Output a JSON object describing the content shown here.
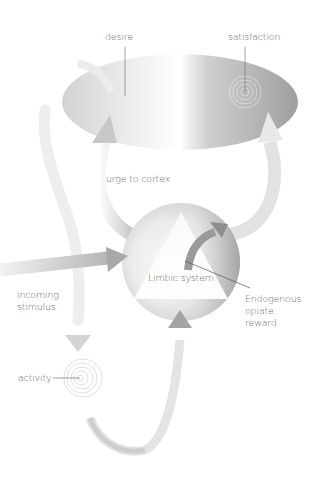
{
  "diagram": {
    "labels": {
      "desire": "desire",
      "satisfaction": "satisfaction",
      "urge": "urge to cortex",
      "limbic": "Limbic system",
      "incoming_line1": "incoming",
      "incoming_line2": "stimulus",
      "opiate_line1": "Endogenous",
      "opiate_line2": "opiate",
      "opiate_line3": "reward",
      "activity": "activity"
    },
    "nodes": [
      {
        "id": "cortex",
        "shape": "ellipse"
      },
      {
        "id": "limbic-system",
        "shape": "circle-with-triangle"
      },
      {
        "id": "activity",
        "shape": "spiral"
      }
    ],
    "edges": [
      {
        "from": "incoming-stimulus",
        "to": "limbic-system"
      },
      {
        "from": "limbic-system",
        "to": "cortex",
        "label": "urge to cortex"
      },
      {
        "from": "limbic-system",
        "to": "satisfaction"
      },
      {
        "from": "desire",
        "to": "activity"
      },
      {
        "from": "activity",
        "to": "limbic-system"
      },
      {
        "from": "limbic-system",
        "to": "opiate-reward"
      }
    ],
    "colors": {
      "arrow_light": "#e6e6e6",
      "arrow_dark": "#9a9a9a",
      "text": "#6a6a6a"
    }
  }
}
